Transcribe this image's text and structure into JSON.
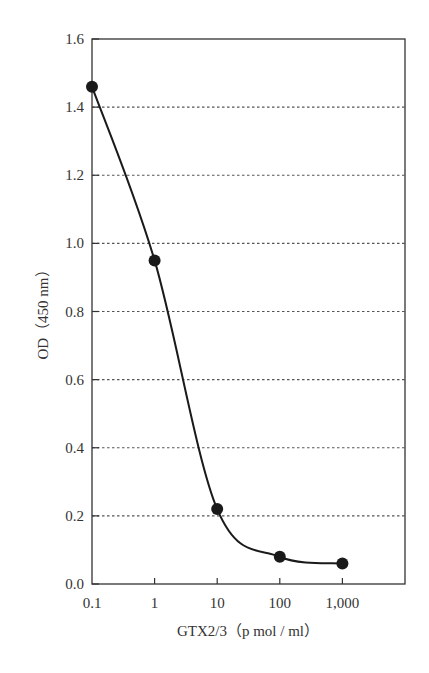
{
  "chart_data": {
    "type": "line",
    "title": "",
    "xlabel": "GTX2/3（p mol / ml）",
    "ylabel": "OD（450 nm）",
    "xscale": "log",
    "x": [
      0.1,
      1,
      10,
      100,
      1000
    ],
    "x_tick_labels": [
      "0.1",
      "1",
      "10",
      "100",
      "1,000"
    ],
    "y_tick_labels": [
      "0.0",
      "0.2",
      "0.4",
      "0.6",
      "0.8",
      "1.0",
      "1.2",
      "1.4",
      "1.6"
    ],
    "ylim": [
      0.0,
      1.6
    ],
    "xlim_decades": [
      0.1,
      10000
    ],
    "grid": "horizontal dotted",
    "legend": null,
    "series": [
      {
        "name": "GTX2/3 standard curve",
        "values": [
          1.46,
          0.95,
          0.22,
          0.08,
          0.06
        ],
        "color": "#1a1a1a",
        "marker": "filled-circle",
        "smooth": true
      }
    ]
  }
}
